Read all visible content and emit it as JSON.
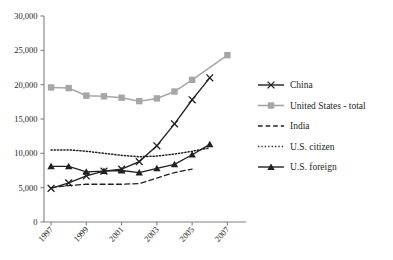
{
  "chart_data": {
    "type": "line",
    "title": "",
    "xlabel": "",
    "ylabel": "",
    "x": [
      1997,
      1998,
      1999,
      2000,
      2001,
      2002,
      2003,
      2004,
      2005,
      2006,
      2007
    ],
    "xtick_labels": [
      "1997",
      "1999",
      "2001",
      "2003",
      "2005",
      "2007"
    ],
    "xtick_values": [
      1997,
      1999,
      2001,
      2003,
      2005,
      2007
    ],
    "ytick_labels": [
      "0",
      "5,000",
      "10,000",
      "15,000",
      "20,000",
      "25,000",
      "30,000"
    ],
    "ytick_values": [
      0,
      5000,
      10000,
      15000,
      20000,
      25000,
      30000
    ],
    "ylim": [
      0,
      30000
    ],
    "xlim": [
      1996.6,
      2007.6
    ],
    "grid": false,
    "legend_position": "right",
    "series": [
      {
        "name": "China",
        "marker": "x",
        "color": "#231f20",
        "style": "solid",
        "values": [
          4900,
          5700,
          6700,
          7400,
          7700,
          8800,
          11100,
          14300,
          17800,
          21000,
          null
        ]
      },
      {
        "name": "United States - total",
        "marker": "square",
        "color": "#a6a6a6",
        "style": "solid",
        "values": [
          19600,
          19500,
          18400,
          18300,
          18100,
          17600,
          18000,
          19000,
          20700,
          null,
          24300
        ]
      },
      {
        "name": "India",
        "marker": "none",
        "color": "#231f20",
        "style": "dashed",
        "values": [
          5000,
          5300,
          5500,
          5500,
          5500,
          5600,
          6400,
          7200,
          7700,
          null,
          null
        ]
      },
      {
        "name": "U.S. citizen",
        "marker": "none",
        "color": "#231f20",
        "style": "dotted",
        "values": [
          10500,
          10500,
          10300,
          10000,
          9700,
          9500,
          9600,
          9900,
          10300,
          10800,
          null
        ]
      },
      {
        "name": "U.S. foreign",
        "marker": "triangle",
        "color": "#231f20",
        "style": "solid",
        "values": [
          8100,
          8100,
          7300,
          7400,
          7500,
          7200,
          7800,
          8400,
          9800,
          11300,
          null
        ]
      }
    ]
  }
}
